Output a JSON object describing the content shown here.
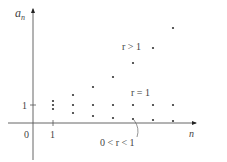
{
  "chart_data": {
    "type": "scatter",
    "title": "",
    "xlabel": "n",
    "ylabel": "a_n",
    "x_ticks": [
      "0",
      "1"
    ],
    "y_ticks": [
      "1"
    ],
    "grid": false,
    "x": [
      1,
      2,
      3,
      4,
      5,
      6,
      7
    ],
    "series": [
      {
        "name": "r > 1",
        "values": [
          1.2,
          1.5,
          1.9,
          2.4,
          3.1,
          3.8,
          4.8
        ]
      },
      {
        "name": "r = 1",
        "values": [
          1,
          1,
          1,
          1,
          1,
          1,
          1
        ]
      },
      {
        "name": "0 < r < 1",
        "values": [
          0.8,
          0.6,
          0.45,
          0.35,
          0.28,
          0.22,
          0.17
        ]
      }
    ],
    "annotations": [
      "r > 1",
      "r = 1",
      "0 < r < 1"
    ]
  },
  "labels": {
    "y_axis_main": "a",
    "y_axis_sub": "n",
    "x_axis": "n",
    "origin": "0",
    "x_tick_1": "1",
    "y_tick_1": "1",
    "r_gt_1": "r > 1",
    "r_eq_1": "r = 1",
    "r_between": "0 < r < 1"
  },
  "geometry": {
    "cols_px": [
      53,
      73,
      93,
      113,
      133,
      153,
      173
    ],
    "r_gt_1_px": [
      101,
      95,
      87,
      77,
      63,
      48,
      28
    ],
    "r_eq_1_px": [
      105,
      105,
      105,
      105,
      105,
      105,
      105
    ],
    "r_lt_1_px": [
      109,
      113,
      116,
      118,
      119,
      120,
      121
    ]
  }
}
